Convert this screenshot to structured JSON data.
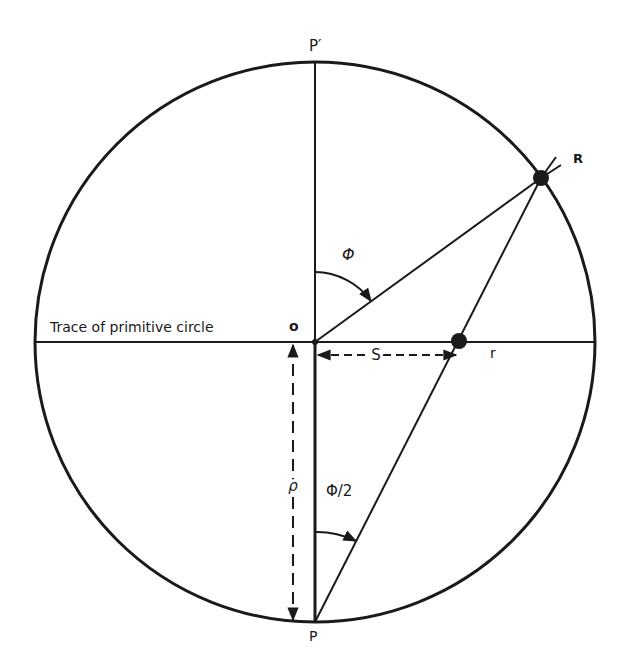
{
  "diagram": {
    "type": "stereographic projection construction",
    "labels": {
      "top_pole": "P′",
      "bottom_pole": "P",
      "center": "o",
      "point_on_sphere": "R",
      "projected_point": "r",
      "primitive_trace": "Trace of primitive circle",
      "angle_phi": "Φ",
      "angle_half_phi": "Φ/2",
      "distance_s": "S",
      "radius_rho": "ρ"
    },
    "colors": {
      "ink": "#1a1a1a",
      "background": "#ffffff"
    }
  }
}
